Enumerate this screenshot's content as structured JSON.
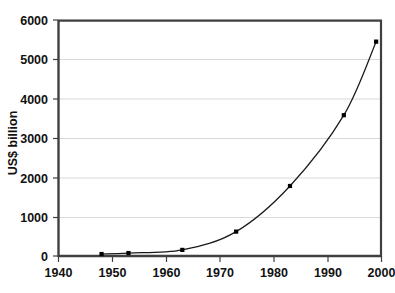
{
  "chart_data": {
    "type": "line",
    "title": "",
    "xlabel": "",
    "ylabel": "US$ billion",
    "xlim": [
      1940,
      2000
    ],
    "ylim": [
      0,
      6000
    ],
    "grid": "horizontal",
    "legend": "none",
    "marker": "square",
    "x": [
      1948,
      1953,
      1963,
      1973,
      1983,
      1993,
      1999
    ],
    "values": [
      50,
      75,
      155,
      620,
      1780,
      3580,
      5450
    ],
    "series": [
      {
        "name": "US$ billion",
        "x": [
          1948,
          1953,
          1963,
          1973,
          1983,
          1993,
          1999
        ],
        "values": [
          50,
          75,
          155,
          620,
          1780,
          3580,
          5450
        ]
      }
    ],
    "xticks": [
      1940,
      1950,
      1960,
      1970,
      1980,
      1990,
      2000
    ],
    "xtick_labels": [
      "1940",
      "1950",
      "1960",
      "1970",
      "1980",
      "1990",
      "2000"
    ],
    "yticks": [
      0,
      1000,
      2000,
      3000,
      4000,
      5000,
      6000
    ],
    "ytick_labels": [
      "0",
      "1000",
      "2000",
      "3000",
      "4000",
      "5000",
      "6000"
    ],
    "colors": {
      "line": "#1a1a1a",
      "marker": "#000000",
      "grid": "#d9d9d9",
      "axis": "#404040",
      "plot_background": "#ffffff",
      "figure_background": "#ffffff",
      "text": "#111111"
    }
  }
}
